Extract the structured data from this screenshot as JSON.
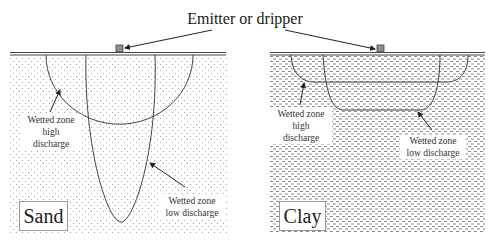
{
  "title": "Emitter or dripper",
  "panels": [
    {
      "soil": "Sand",
      "labels": {
        "high": [
          "Wetted zone",
          "high",
          "discharge"
        ],
        "low": [
          "Wetted zone",
          "low discharge"
        ]
      }
    },
    {
      "soil": "Clay",
      "labels": {
        "high": [
          "Wetted zone",
          "high",
          "discharge"
        ],
        "low": [
          "Wetted zone",
          "low discharge"
        ]
      }
    }
  ],
  "colors": {
    "line": "#333333",
    "emitter": "#8c8c8c",
    "pattern": "#9a9a9a"
  }
}
